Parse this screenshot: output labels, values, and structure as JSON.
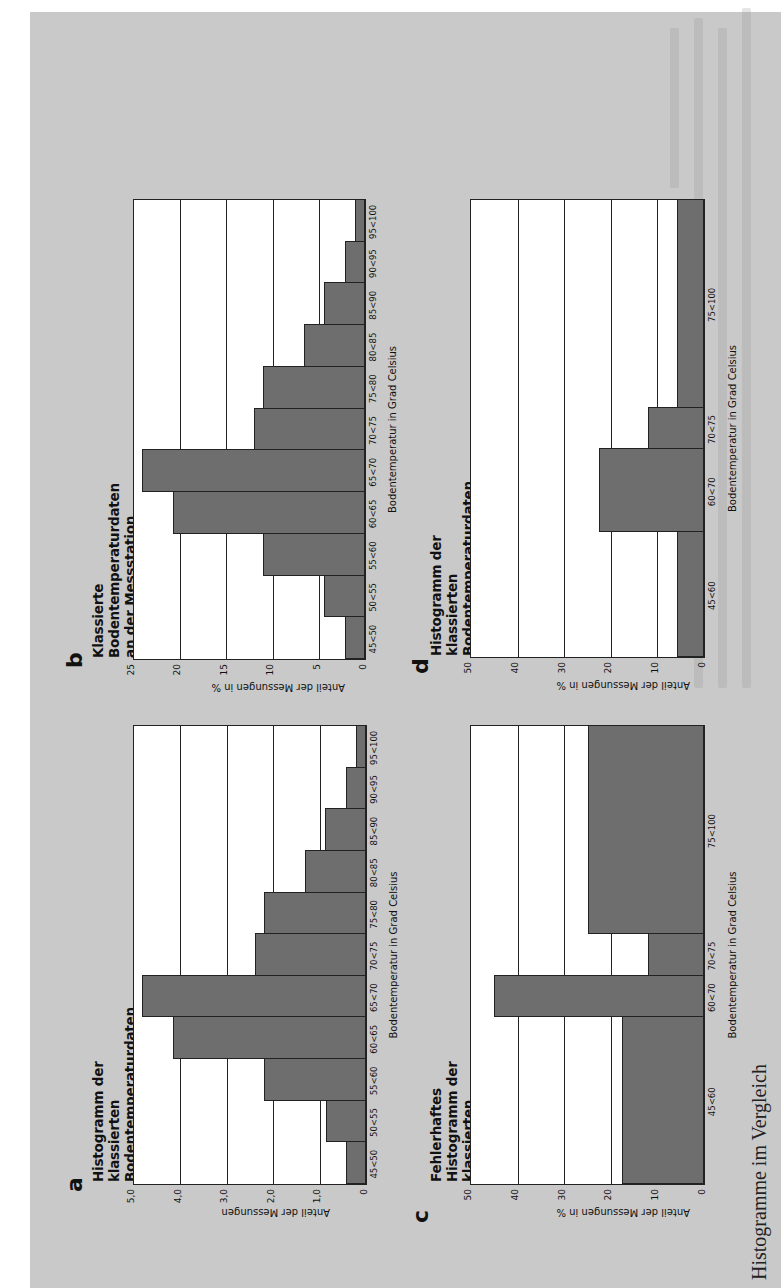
{
  "page": {
    "caption": "Histogramme im Vergleich",
    "bar_color": "#6e6e6e",
    "paper_color": "#c9c9c9"
  },
  "panels": [
    {
      "letter": "a",
      "title": "Histogramm der klassierten Bodentemperaturdaten an der\nMessstation Thermalquelle (April bis Juni 2008)",
      "ylabel": "Anteil der Messungen",
      "xlabel": "Bodentemperatur in Grad Celsius"
    },
    {
      "letter": "b",
      "title": "Klassierte Bodentemperaturdaten an der Messstation\nThermalquelle (April bis Juni 2008)",
      "ylabel": "Anteil der Messungen in %",
      "xlabel": "Bodentemperatur in Grad Celsius"
    },
    {
      "letter": "c",
      "title": "Fehlerhaftes Histogramm der klassierten Bodentemperatur-\ndaten an der Messstation Thermalquelle (April bis Juni 2008)",
      "ylabel": "Anteil der Messungen in %",
      "xlabel": "Bodentemperatur in Grad Celsius"
    },
    {
      "letter": "d",
      "title": "Histogramm der klassierten Bodentemperaturdaten an der\nMessstation Thermalquelle (April bis Juni 2008)",
      "ylabel": "Anteil der Messungen in %",
      "xlabel": "Bodentemperatur in Grad Celsius"
    }
  ],
  "chart_data": [
    {
      "panel": "a",
      "type": "bar",
      "title": "Histogramm der klassierten Bodentemperaturdaten an der Messstation Thermalquelle (April bis Juni 2008)",
      "xlabel": "Bodentemperatur in Grad Celsius",
      "ylabel": "Anteil der Messungen",
      "categories": [
        "45<50",
        "50<55",
        "55<60",
        "60<65",
        "65<70",
        "70<75",
        "75<80",
        "80<85",
        "85<90",
        "90<95",
        "95<100"
      ],
      "widths": [
        1,
        1,
        1,
        1,
        1,
        1,
        1,
        1,
        1,
        1,
        1
      ],
      "values": [
        0.44,
        0.87,
        2.2,
        4.16,
        4.82,
        2.4,
        2.2,
        1.32,
        0.88,
        0.44,
        0.22
      ],
      "ylim": [
        0,
        5
      ],
      "yticks": [
        "0",
        "1,0",
        "2,0",
        "3,0",
        "4,0",
        "5,0"
      ],
      "ytick_values": [
        0,
        1,
        2,
        3,
        4,
        5
      ],
      "grid": true
    },
    {
      "panel": "b",
      "type": "bar",
      "title": "Klassierte Bodentemperaturdaten an der Messstation Thermalquelle (April bis Juni 2008)",
      "xlabel": "Bodentemperatur in Grad Celsius",
      "ylabel": "Anteil der Messungen in %",
      "categories": [
        "45<50",
        "50<55",
        "55<60",
        "60<65",
        "65<70",
        "70<75",
        "75<80",
        "80<85",
        "85<90",
        "90<95",
        "95<100"
      ],
      "widths": [
        1,
        1,
        1,
        1,
        1,
        1,
        1,
        1,
        1,
        1,
        1
      ],
      "values": [
        2.2,
        4.4,
        11.0,
        20.8,
        24.1,
        12.0,
        11.0,
        6.6,
        4.4,
        2.2,
        1.1
      ],
      "ylim": [
        0,
        25
      ],
      "yticks": [
        "0",
        "5",
        "10",
        "15",
        "20",
        "25"
      ],
      "ytick_values": [
        0,
        5,
        10,
        15,
        20,
        25
      ],
      "grid": true
    },
    {
      "panel": "c",
      "type": "bar",
      "title": "Fehlerhaftes Histogramm der klassierten Bodentemperaturdaten an der Messstation Thermalquelle (April bis Juni 2008)",
      "xlabel": "Bodentemperatur in Grad Celsius",
      "ylabel": "Anteil der Messungen in %",
      "categories": [
        "45<60",
        "60<70",
        "70<75",
        "75<100"
      ],
      "widths": [
        4,
        1,
        1,
        5
      ],
      "values": [
        17.5,
        45.0,
        12.0,
        25.0
      ],
      "ylim": [
        0,
        50
      ],
      "yticks": [
        "0",
        "10",
        "20",
        "30",
        "40",
        "50"
      ],
      "ytick_values": [
        0,
        10,
        20,
        30,
        40,
        50
      ],
      "grid": true
    },
    {
      "panel": "d",
      "type": "bar",
      "title": "Histogramm der klassierten Bodentemperaturdaten an der Messstation Thermalquelle (April bis Juni 2008)",
      "xlabel": "Bodentemperatur in Grad Celsius",
      "ylabel": "Anteil der Messungen in %",
      "categories": [
        "45<60",
        "60<70",
        "70<75",
        "75<100"
      ],
      "widths": [
        3,
        2,
        1,
        5
      ],
      "values": [
        5.8,
        22.5,
        12.0,
        5.8
      ],
      "ylim": [
        0,
        50
      ],
      "yticks": [
        "0",
        "10",
        "20",
        "30",
        "40",
        "50"
      ],
      "ytick_values": [
        0,
        10,
        20,
        30,
        40,
        50
      ],
      "grid": true
    }
  ]
}
